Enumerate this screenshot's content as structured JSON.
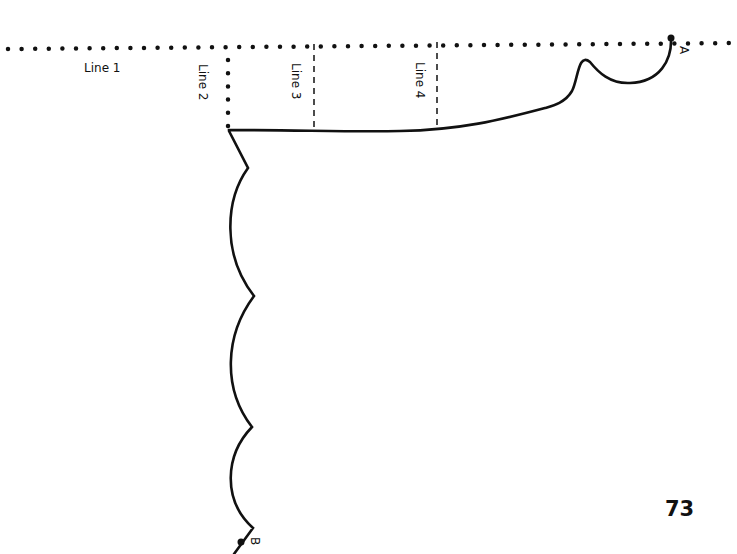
{
  "pattern": {
    "lines": [
      {
        "id": "line1",
        "label": "Line 1",
        "style": "dotted",
        "orientation": "horizontal"
      },
      {
        "id": "line2",
        "label": "Line 2",
        "style": "dotted",
        "orientation": "vertical"
      },
      {
        "id": "line3",
        "label": "Line 3",
        "style": "dashed",
        "orientation": "vertical"
      },
      {
        "id": "line4",
        "label": "Line 4",
        "style": "dashed",
        "orientation": "vertical"
      }
    ],
    "points": [
      {
        "id": "A",
        "label": "A"
      },
      {
        "id": "B",
        "label": "B"
      }
    ]
  },
  "page_number": "73",
  "colors": {
    "ink": "#111111",
    "paper": "#ffffff"
  }
}
